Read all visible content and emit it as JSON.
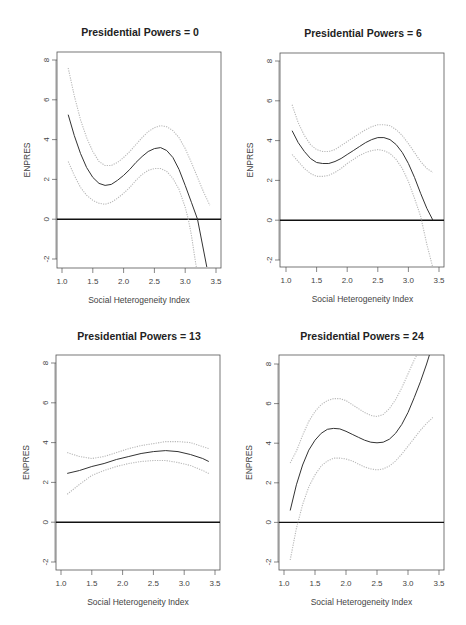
{
  "figure": {
    "width": 466,
    "height": 625
  },
  "colors": {
    "mean": "#333333",
    "band": "#b8b8b8",
    "zero": "#111111",
    "frame": "#555555",
    "text": "#222222"
  },
  "chart_data": [
    {
      "type": "line",
      "title": "Presidential Powers = 0",
      "xlabel": "Social Heterogeneity Index",
      "ylabel": "ENPRES",
      "xlim": [
        0.95,
        3.6
      ],
      "ylim": [
        -2.4,
        8.4
      ],
      "xticks": [
        "1.0",
        "1.5",
        "2.0",
        "2.5",
        "3.0",
        "3.5"
      ],
      "yticks": [
        "-2",
        "0",
        "2",
        "4",
        "6",
        "8"
      ],
      "hline": 0,
      "series": [
        {
          "name": "estimate",
          "x": [
            1.1,
            1.2,
            1.3,
            1.4,
            1.5,
            1.6,
            1.7,
            1.8,
            1.9,
            2.0,
            2.1,
            2.2,
            2.3,
            2.4,
            2.5,
            2.6,
            2.7,
            2.8,
            2.9,
            3.0,
            3.1,
            3.2,
            3.3,
            3.35
          ],
          "y": [
            5.25,
            4.2,
            3.3,
            2.6,
            2.1,
            1.8,
            1.7,
            1.75,
            1.95,
            2.2,
            2.5,
            2.85,
            3.15,
            3.4,
            3.55,
            3.6,
            3.45,
            3.1,
            2.5,
            1.7,
            0.85,
            0.0,
            -1.6,
            -2.4
          ]
        },
        {
          "name": "upper",
          "x": [
            1.1,
            1.2,
            1.3,
            1.4,
            1.5,
            1.6,
            1.7,
            1.8,
            1.9,
            2.0,
            2.1,
            2.2,
            2.3,
            2.4,
            2.5,
            2.6,
            2.7,
            2.8,
            2.9,
            3.0,
            3.1,
            3.2,
            3.3,
            3.4
          ],
          "y": [
            7.6,
            6.2,
            5.0,
            4.1,
            3.4,
            2.9,
            2.7,
            2.7,
            2.85,
            3.1,
            3.4,
            3.75,
            4.1,
            4.4,
            4.6,
            4.7,
            4.65,
            4.45,
            4.1,
            3.55,
            2.85,
            2.1,
            1.35,
            0.7
          ]
        },
        {
          "name": "lower",
          "x": [
            1.1,
            1.2,
            1.3,
            1.4,
            1.5,
            1.6,
            1.7,
            1.8,
            1.9,
            2.0,
            2.1,
            2.2,
            2.3,
            2.4,
            2.5,
            2.6,
            2.7,
            2.8,
            2.9,
            3.0,
            3.05,
            3.1,
            3.15,
            3.18
          ],
          "y": [
            2.9,
            2.2,
            1.6,
            1.2,
            0.95,
            0.8,
            0.75,
            0.85,
            1.05,
            1.3,
            1.6,
            1.95,
            2.25,
            2.45,
            2.55,
            2.55,
            2.4,
            2.05,
            1.5,
            0.6,
            0.0,
            -0.8,
            -1.8,
            -2.4
          ]
        }
      ]
    },
    {
      "type": "line",
      "title": "Presidential Powers = 6",
      "xlabel": "Social Heterogeneity Index",
      "ylabel": "ENPRES",
      "xlim": [
        0.95,
        3.6
      ],
      "ylim": [
        -2.4,
        8.4
      ],
      "xticks": [
        "1.0",
        "1.5",
        "2.0",
        "2.5",
        "3.0",
        "3.5"
      ],
      "yticks": [
        "-2",
        "0",
        "2",
        "4",
        "6",
        "8"
      ],
      "hline": 0,
      "series": [
        {
          "name": "estimate",
          "x": [
            1.1,
            1.2,
            1.3,
            1.4,
            1.5,
            1.6,
            1.7,
            1.8,
            1.9,
            2.0,
            2.1,
            2.2,
            2.3,
            2.4,
            2.5,
            2.6,
            2.7,
            2.8,
            2.9,
            3.0,
            3.1,
            3.2,
            3.3,
            3.4
          ],
          "y": [
            4.5,
            3.9,
            3.45,
            3.1,
            2.9,
            2.85,
            2.85,
            2.95,
            3.1,
            3.3,
            3.5,
            3.7,
            3.9,
            4.05,
            4.15,
            4.15,
            4.05,
            3.8,
            3.4,
            2.85,
            2.15,
            1.35,
            0.6,
            0.0
          ]
        },
        {
          "name": "upper",
          "x": [
            1.1,
            1.2,
            1.3,
            1.4,
            1.5,
            1.6,
            1.7,
            1.8,
            1.9,
            2.0,
            2.1,
            2.2,
            2.3,
            2.4,
            2.5,
            2.6,
            2.7,
            2.8,
            2.9,
            3.0,
            3.1,
            3.2,
            3.3,
            3.4
          ],
          "y": [
            5.8,
            4.9,
            4.25,
            3.8,
            3.55,
            3.45,
            3.45,
            3.55,
            3.75,
            3.95,
            4.15,
            4.35,
            4.55,
            4.7,
            4.8,
            4.8,
            4.75,
            4.55,
            4.25,
            3.85,
            3.4,
            2.95,
            2.6,
            2.4
          ]
        },
        {
          "name": "lower",
          "x": [
            1.1,
            1.2,
            1.3,
            1.4,
            1.5,
            1.6,
            1.7,
            1.8,
            1.9,
            2.0,
            2.1,
            2.2,
            2.3,
            2.4,
            2.5,
            2.6,
            2.7,
            2.8,
            2.9,
            3.0,
            3.1,
            3.2,
            3.3,
            3.4
          ],
          "y": [
            3.3,
            2.95,
            2.6,
            2.35,
            2.2,
            2.2,
            2.25,
            2.4,
            2.6,
            2.85,
            3.05,
            3.25,
            3.4,
            3.5,
            3.55,
            3.5,
            3.35,
            3.05,
            2.6,
            1.95,
            1.1,
            0.2,
            -1.2,
            -2.4
          ]
        }
      ]
    },
    {
      "type": "line",
      "title": "Presidential Powers = 13",
      "xlabel": "Social Heterogeneity Index",
      "ylabel": "ENPRES",
      "xlim": [
        0.95,
        3.6
      ],
      "ylim": [
        -2.4,
        8.4
      ],
      "xticks": [
        "1.0",
        "1.5",
        "2.0",
        "2.5",
        "3.0",
        "3.5"
      ],
      "yticks": [
        "-2",
        "0",
        "2",
        "4",
        "6",
        "8"
      ],
      "hline": 0,
      "series": [
        {
          "name": "estimate",
          "x": [
            1.1,
            1.3,
            1.5,
            1.7,
            1.9,
            2.1,
            2.3,
            2.5,
            2.7,
            2.9,
            3.1,
            3.3,
            3.4
          ],
          "y": [
            2.45,
            2.6,
            2.8,
            2.95,
            3.15,
            3.3,
            3.45,
            3.55,
            3.6,
            3.55,
            3.4,
            3.2,
            3.05
          ]
        },
        {
          "name": "upper",
          "x": [
            1.1,
            1.3,
            1.5,
            1.7,
            1.9,
            2.1,
            2.3,
            2.5,
            2.7,
            2.9,
            3.1,
            3.3,
            3.4
          ],
          "y": [
            3.5,
            3.3,
            3.2,
            3.3,
            3.5,
            3.7,
            3.85,
            3.95,
            4.05,
            4.05,
            4.0,
            3.8,
            3.7
          ]
        },
        {
          "name": "lower",
          "x": [
            1.1,
            1.3,
            1.5,
            1.7,
            1.9,
            2.1,
            2.3,
            2.5,
            2.7,
            2.9,
            3.1,
            3.3,
            3.4
          ],
          "y": [
            1.4,
            1.9,
            2.35,
            2.6,
            2.8,
            2.95,
            3.05,
            3.1,
            3.1,
            3.0,
            2.85,
            2.6,
            2.45
          ]
        }
      ]
    },
    {
      "type": "line",
      "title": "Presidential Powers = 24",
      "xlabel": "Social Heterogeneity Index",
      "ylabel": "ENPRES",
      "xlim": [
        0.95,
        3.6
      ],
      "ylim": [
        -2.4,
        8.4
      ],
      "xticks": [
        "1.0",
        "1.5",
        "2.0",
        "2.5",
        "3.0",
        "3.5"
      ],
      "yticks": [
        "-2",
        "0",
        "2",
        "4",
        "6",
        "8"
      ],
      "hline": 0,
      "series": [
        {
          "name": "estimate",
          "x": [
            1.1,
            1.2,
            1.3,
            1.4,
            1.5,
            1.6,
            1.7,
            1.8,
            1.9,
            2.0,
            2.1,
            2.2,
            2.3,
            2.4,
            2.5,
            2.6,
            2.7,
            2.8,
            2.9,
            3.0,
            3.1,
            3.2,
            3.3,
            3.35
          ],
          "y": [
            0.6,
            1.9,
            2.9,
            3.65,
            4.15,
            4.5,
            4.7,
            4.75,
            4.72,
            4.6,
            4.45,
            4.3,
            4.15,
            4.05,
            4.02,
            4.05,
            4.2,
            4.5,
            4.95,
            5.55,
            6.3,
            7.1,
            8.0,
            8.5
          ]
        },
        {
          "name": "upper",
          "x": [
            1.1,
            1.2,
            1.3,
            1.4,
            1.5,
            1.6,
            1.7,
            1.8,
            1.9,
            2.0,
            2.1,
            2.2,
            2.3,
            2.4,
            2.5,
            2.6,
            2.7,
            2.8,
            2.9,
            3.0,
            3.1,
            3.15
          ],
          "y": [
            3.0,
            3.6,
            4.4,
            5.1,
            5.6,
            5.95,
            6.15,
            6.25,
            6.25,
            6.15,
            5.95,
            5.75,
            5.55,
            5.4,
            5.35,
            5.45,
            5.75,
            6.2,
            6.8,
            7.5,
            8.2,
            8.5
          ]
        },
        {
          "name": "lower",
          "x": [
            1.1,
            1.2,
            1.3,
            1.4,
            1.5,
            1.6,
            1.7,
            1.8,
            1.9,
            2.0,
            2.1,
            2.2,
            2.3,
            2.4,
            2.5,
            2.6,
            2.7,
            2.8,
            2.9,
            3.0,
            3.1,
            3.2,
            3.3,
            3.4
          ],
          "y": [
            -1.9,
            -0.3,
            0.9,
            1.8,
            2.4,
            2.85,
            3.1,
            3.25,
            3.25,
            3.2,
            3.1,
            2.95,
            2.8,
            2.7,
            2.65,
            2.7,
            2.85,
            3.1,
            3.45,
            3.85,
            4.25,
            4.65,
            5.0,
            5.3
          ]
        }
      ]
    }
  ],
  "panels_layout": [
    {
      "left": 57,
      "top": 52,
      "right": 221,
      "bottom": 268,
      "x_at_1": 62,
      "x_at_3_5": 216,
      "y_at_8": 60,
      "y_at_m2": 259,
      "title_x": 140,
      "title_y": 36
    },
    {
      "left": 280,
      "top": 53,
      "right": 444,
      "bottom": 267,
      "x_at_1": 286,
      "x_at_3_5": 439,
      "y_at_8": 61,
      "y_at_m2": 260,
      "title_x": 363,
      "title_y": 37
    },
    {
      "left": 56,
      "top": 355,
      "right": 220,
      "bottom": 570,
      "x_at_1": 61,
      "x_at_3_5": 215,
      "y_at_8": 363,
      "y_at_m2": 562,
      "title_x": 139,
      "title_y": 340
    },
    {
      "left": 279,
      "top": 355,
      "right": 444,
      "bottom": 570,
      "x_at_1": 284,
      "x_at_3_5": 439,
      "y_at_8": 364,
      "y_at_m2": 562,
      "title_x": 362,
      "title_y": 340
    }
  ]
}
